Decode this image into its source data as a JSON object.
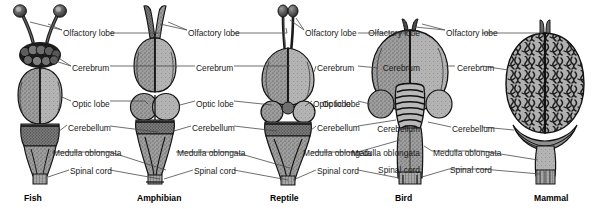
{
  "figure": {
    "background_color": "#ffffff",
    "label_color": "#1a1a1a",
    "leader_color": "#4a4a4a",
    "specimens": [
      {
        "caption": "Fish",
        "caption_x": 24,
        "center_x": 40,
        "labels": [
          {
            "text": "Olfactory lobe",
            "x": 63,
            "y": 33,
            "anchor": "start",
            "side": "right"
          },
          {
            "text": "Cerebrum",
            "x": 72,
            "y": 68,
            "anchor": "start",
            "side": "right"
          },
          {
            "text": "Optic lobe",
            "x": 72,
            "y": 104,
            "anchor": "start",
            "side": "right"
          },
          {
            "text": "Cerebellum",
            "x": 68,
            "y": 128,
            "anchor": "start",
            "side": "right"
          },
          {
            "text": "Medulla oblongata",
            "x": 53,
            "y": 155,
            "anchor": "start",
            "side": "right"
          },
          {
            "text": "Spinal cord",
            "x": 70,
            "y": 173,
            "anchor": "start",
            "side": "right"
          }
        ]
      },
      {
        "caption": "Amphibian",
        "caption_x": 137,
        "center_x": 155,
        "labels": [
          {
            "text": "Olfactory lobe",
            "x": 188,
            "y": 33,
            "anchor": "start",
            "side": "right"
          },
          {
            "text": "Cerebrum",
            "x": 196,
            "y": 68,
            "anchor": "start",
            "side": "right"
          },
          {
            "text": "Optic lobe",
            "x": 196,
            "y": 104,
            "anchor": "start",
            "side": "right"
          },
          {
            "text": "Cerebellum",
            "x": 192,
            "y": 128,
            "anchor": "start",
            "side": "right"
          },
          {
            "text": "Medulla oblongata",
            "x": 177,
            "y": 155,
            "anchor": "start",
            "side": "right"
          },
          {
            "text": "Spinal cord",
            "x": 194,
            "y": 173,
            "anchor": "start",
            "side": "right"
          }
        ]
      },
      {
        "caption": "Reptile",
        "caption_x": 270,
        "center_x": 288,
        "labels": [
          {
            "text": "Olfactory lobe",
            "x": 305,
            "y": 33,
            "anchor": "start",
            "side": "right"
          },
          {
            "text": "Cerebrum",
            "x": 317,
            "y": 68,
            "anchor": "start",
            "side": "right"
          },
          {
            "text": "Optic lobe",
            "x": 313,
            "y": 104,
            "anchor": "start",
            "side": "right"
          },
          {
            "text": "Cerebellum",
            "x": 317,
            "y": 128,
            "anchor": "start",
            "side": "right"
          },
          {
            "text": "Medulla oblongata",
            "x": 303,
            "y": 155,
            "anchor": "start",
            "side": "right"
          },
          {
            "text": "Spinal cord",
            "x": 317,
            "y": 173,
            "anchor": "start",
            "side": "right"
          }
        ]
      },
      {
        "caption": "Bird",
        "caption_x": 395,
        "center_x": 410,
        "labels": [
          {
            "text": "Olfactory lobe",
            "x": 446,
            "y": 33,
            "anchor": "start",
            "side": "right"
          },
          {
            "text": "Cerebrum",
            "x": 457,
            "y": 68,
            "anchor": "start",
            "side": "right"
          },
          {
            "text": "Optic lobe",
            "x": 360,
            "y": 104,
            "anchor": "end",
            "side": "left"
          },
          {
            "text": "Cerebellum",
            "x": 452,
            "y": 129,
            "anchor": "start",
            "side": "right"
          },
          {
            "text": "Medulla oblongata",
            "x": 433,
            "y": 153,
            "anchor": "start",
            "side": "right"
          },
          {
            "text": "Spinal cord",
            "x": 450,
            "y": 172,
            "anchor": "start",
            "side": "right"
          }
        ]
      },
      {
        "caption": "Mammal",
        "caption_x": 534,
        "center_x": 545,
        "labels": []
      }
    ],
    "captions": [
      "Fish",
      "Amphibian",
      "Reptile",
      "Bird",
      "Mammal"
    ],
    "parts": [
      "Olfactory lobe",
      "Cerebrum",
      "Optic lobe",
      "Cerebellum",
      "Medulla oblongata",
      "Spinal cord"
    ]
  }
}
